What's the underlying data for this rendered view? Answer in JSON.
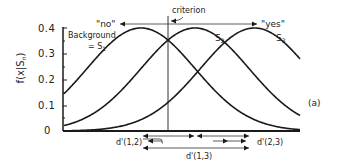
{
  "chart_data": {
    "type": "line",
    "title": "",
    "xlabel": "",
    "ylabel": "f(x|S_n)",
    "ylim": [
      0,
      0.4
    ],
    "y_ticks": [
      "0",
      "0.1",
      "0.2",
      "0.3",
      "0.4"
    ],
    "grid": false,
    "series": [
      {
        "name": "S1",
        "mean": 1.0,
        "sd": 1.0,
        "peak": 0.4
      },
      {
        "name": "S2",
        "mean": 2.0,
        "sd": 1.0,
        "peak": 0.4
      },
      {
        "name": "S3",
        "mean": 3.1,
        "sd": 1.0,
        "peak": 0.4
      }
    ],
    "annotations": {
      "criterion": "criterion",
      "no": "\"no\"",
      "yes": "\"yes\"",
      "background": "Background",
      "background_eq": "= S",
      "background_sub": "1",
      "s2_label": "S",
      "s2_sub": "2",
      "s3_label": "S",
      "s3_sub": "3",
      "panel": "(a)",
      "d12": "d'(1,2)",
      "d23": "d'(2,3)",
      "d13": "d'(1,3)"
    }
  },
  "axis": {
    "ylabel_main": "f(x|S",
    "ylabel_sub": "n",
    "ylabel_end": ")"
  },
  "colors": {
    "line": "#1a1a1a",
    "axis": "#1a1a1a",
    "text": "#222222"
  }
}
